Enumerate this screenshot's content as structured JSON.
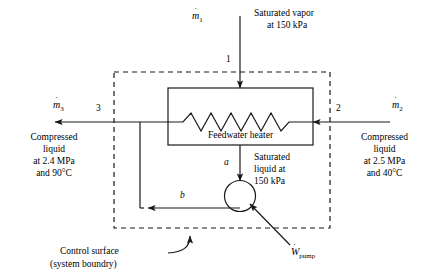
{
  "figure": {
    "type": "thermodynamics-schematic"
  },
  "streams": {
    "inlet_top": {
      "mdot_symbol": "m",
      "mdot_sub": "1",
      "state_label": "1",
      "description_line1": "Saturated vapor",
      "description_line2": "at 150 kPa"
    },
    "outlet_left": {
      "mdot_symbol": "m",
      "mdot_sub": "3",
      "state_label": "3",
      "description_line1": "Compressed",
      "description_line2": "liquid",
      "description_line3": "at 2.4 MPa",
      "description_line4": "and 90°C"
    },
    "inlet_right": {
      "mdot_symbol": "m",
      "mdot_sub": "2",
      "state_label": "2",
      "description_line1": "Compressed",
      "description_line2": "liquid",
      "description_line3": "at 2.5 MPa",
      "description_line4": "and 40°C"
    },
    "pump_inlet": {
      "state_label": "a",
      "description_line1": "Saturated",
      "description_line2": "liquid at",
      "description_line3": "150 kPa"
    },
    "pump_outlet": {
      "state_label": "b"
    }
  },
  "components": {
    "feedwater_heater": {
      "label": "Feedwater heater"
    },
    "pump": {
      "work_symbol": "W",
      "work_sub": "pump"
    }
  },
  "annotations": {
    "control_surface_line1": "Control surface",
    "control_surface_line2": "(system boundry)"
  },
  "style": {
    "line_color": "#1a1a1a",
    "background": "#ffffff"
  }
}
